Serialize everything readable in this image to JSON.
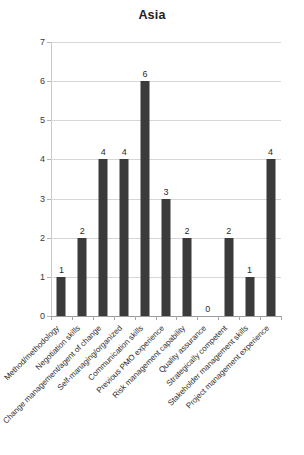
{
  "chart_data": {
    "type": "bar",
    "title": "Asia",
    "xlabel": "",
    "ylabel": "",
    "ylim": [
      0,
      7
    ],
    "yticks": [
      0,
      1,
      2,
      3,
      4,
      5,
      6,
      7
    ],
    "grid": true,
    "legend": "none",
    "bar_color": "#3b3b3b",
    "categories": [
      "Method/methodology",
      "Negotiation skills",
      "Change management/agent of change",
      "Self-managing/organized",
      "Communication skills",
      "Previous PMO experience",
      "Risk management capability",
      "Quality assurance",
      "Strategically competent",
      "Stakeholder management skills",
      "Project management experience"
    ],
    "values": [
      1,
      2,
      4,
      4,
      6,
      3,
      2,
      0,
      2,
      1,
      4
    ],
    "data_labels": [
      "1",
      "2",
      "4",
      "4",
      "6",
      "3",
      "2",
      "0",
      "2",
      "1",
      "4"
    ]
  }
}
